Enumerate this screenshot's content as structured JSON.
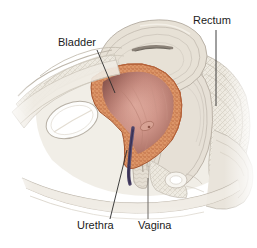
{
  "figure": {
    "background_color": "#ffffff",
    "width": 257,
    "height": 248
  },
  "labels": [
    {
      "id": "rectum",
      "text": "Rectum",
      "text_x": 193,
      "text_y": 24,
      "anchor": "start",
      "leader": "M 216 30 L 216 106",
      "leader_style": "dark"
    },
    {
      "id": "bladder",
      "text": "Bladder",
      "text_x": 58,
      "text_y": 46,
      "anchor": "start",
      "leader": "M 97 50 L 115 93",
      "leader_style": "dark"
    },
    {
      "id": "urethra",
      "text": "Urethra",
      "text_x": 77,
      "text_y": 229,
      "anchor": "start",
      "leader": "M 110 219 L 127 150",
      "leader_style": "dark"
    },
    {
      "id": "vagina",
      "text": "Vagina",
      "text_x": 138,
      "text_y": 229,
      "anchor": "start",
      "leader": "M 148 219 L 148 178",
      "leader_style": "grey"
    }
  ],
  "palette": {
    "background": "#ffffff",
    "bladder_wall": "#d2825a",
    "bladder_wall_light": "#e0a077",
    "bladder_wall_stipple": "#a8secondary",
    "bladder_lumen_light": "#dfa79b",
    "bladder_lumen_dark": "#7d4a42",
    "bladder_lumen_mid": "#c18c82",
    "urethra_canal": "#4a4266",
    "bone_white": "#fbfbfa",
    "bone_outline": "#b8b2aa",
    "tissue_pale": "#e8e3da",
    "tissue_mid": "#d6cfc4",
    "tissue_grey": "#c3bcb2",
    "tissue_shadow": "#aba49b",
    "uterus_fill": "#e3ddd2",
    "uterus_line": "#b9b1a5",
    "uterus_lumen": "#8d847a",
    "label_text": "#1b1b1b",
    "leader_dark": "#2b2b2b",
    "leader_grey": "#6f6a66"
  },
  "structures": [
    {
      "id": "abdominal-wall",
      "name": "abdominal wall"
    },
    {
      "id": "pubic-bone",
      "name": "pubic bone"
    },
    {
      "id": "bladder-wall",
      "name": "bladder muscular wall"
    },
    {
      "id": "bladder-lumen",
      "name": "bladder lumen"
    },
    {
      "id": "uterus",
      "name": "uterus"
    },
    {
      "id": "rectum-body",
      "name": "rectum"
    },
    {
      "id": "vagina-canal",
      "name": "vagina"
    },
    {
      "id": "urethra-canal",
      "name": "urethra"
    },
    {
      "id": "sacrum",
      "name": "sacrum"
    },
    {
      "id": "anal-sphincter",
      "name": "anal sphincter"
    },
    {
      "id": "perineum",
      "name": "perineum"
    }
  ]
}
